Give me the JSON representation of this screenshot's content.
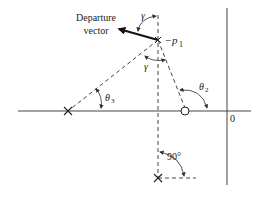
{
  "diagram": {
    "type": "root-locus-angle-of-departure",
    "labels": {
      "departure_line1": "Departure",
      "departure_line2": "vector",
      "gamma_top": "γ",
      "gamma_bottom": "γ",
      "pole_label_prefix": "−",
      "pole_label_var": "p",
      "pole_label_sub": "1",
      "theta2": "θ",
      "theta2_sub": "2",
      "theta3": "θ",
      "theta3_sub": "3",
      "angle_90": "90°",
      "origin": "0"
    },
    "elements": {
      "poles": [
        "−p1 (upper complex pole)",
        "real-axis pole (left)",
        "lower complex pole"
      ],
      "zeros": [
        "real-axis zero (right, near origin)"
      ]
    },
    "colors": {
      "ink": "#222222",
      "axis": "#444444",
      "background": "#ffffff"
    }
  }
}
